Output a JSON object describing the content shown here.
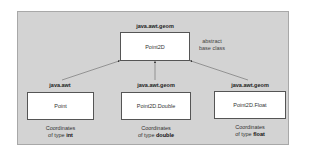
{
  "diagram": {
    "base": {
      "package": "java.awt.geom",
      "class_name": "Point2D",
      "annotation_line1": "abstract",
      "annotation_line2": "base class"
    },
    "subclasses": [
      {
        "package": "java.awt",
        "class_name": "Point",
        "note_line1": "Coordinates",
        "note_prefix": "of type ",
        "note_type": "int"
      },
      {
        "package": "java.awt.geom",
        "class_name": "Point2D.Double",
        "note_line1": "Coordinates",
        "note_prefix": "of type ",
        "note_type": "double"
      },
      {
        "package": "java.awt.geom",
        "class_name": "Point2D.Float",
        "note_line1": "Coordinates",
        "note_prefix": "of type ",
        "note_type": "float"
      }
    ],
    "colors": {
      "panel": "#d3d3d3",
      "box": "#ffffff",
      "line": "#555555"
    }
  }
}
